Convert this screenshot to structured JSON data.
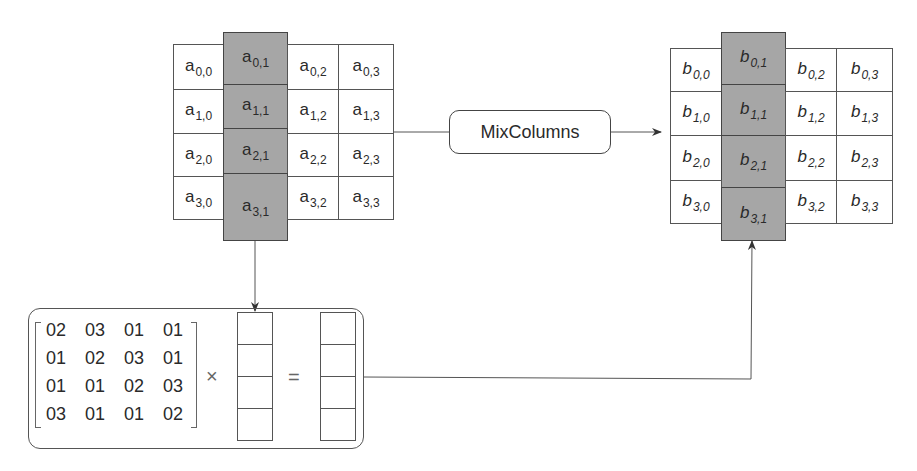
{
  "diagram": {
    "operation_label": "MixColumns",
    "input_state": {
      "symbol": "a",
      "highlighted_column": 1,
      "cells": [
        [
          "a",
          "0,0"
        ],
        [
          "a",
          "0,1"
        ],
        [
          "a",
          "0,2"
        ],
        [
          "a",
          "0,3"
        ],
        [
          "a",
          "1,0"
        ],
        [
          "a",
          "1,1"
        ],
        [
          "a",
          "1,2"
        ],
        [
          "a",
          "1,3"
        ],
        [
          "a",
          "2,0"
        ],
        [
          "a",
          "2,1"
        ],
        [
          "a",
          "2,2"
        ],
        [
          "a",
          "2,3"
        ],
        [
          "a",
          "3,0"
        ],
        [
          "a",
          "3,1"
        ],
        [
          "a",
          "3,2"
        ],
        [
          "a",
          "3,3"
        ]
      ]
    },
    "output_state": {
      "symbol": "b",
      "highlighted_column": 1,
      "cells": [
        [
          "b",
          "0,0"
        ],
        [
          "b",
          "0,1"
        ],
        [
          "b",
          "0,2"
        ],
        [
          "b",
          "0,3"
        ],
        [
          "b",
          "1,0"
        ],
        [
          "b",
          "1,1"
        ],
        [
          "b",
          "1,2"
        ],
        [
          "b",
          "1,3"
        ],
        [
          "b",
          "2,0"
        ],
        [
          "b",
          "2,1"
        ],
        [
          "b",
          "2,2"
        ],
        [
          "b",
          "2,3"
        ],
        [
          "b",
          "3,0"
        ],
        [
          "b",
          "3,1"
        ],
        [
          "b",
          "3,2"
        ],
        [
          "b",
          "3,3"
        ]
      ]
    },
    "matrix": {
      "rows": [
        [
          "02",
          "03",
          "01",
          "01"
        ],
        [
          "01",
          "02",
          "03",
          "01"
        ],
        [
          "01",
          "01",
          "02",
          "03"
        ],
        [
          "03",
          "01",
          "01",
          "02"
        ]
      ],
      "times_symbol": "×",
      "equals_symbol": "="
    },
    "colors": {
      "highlight": "#a6a6a6",
      "line": "#444444"
    }
  }
}
